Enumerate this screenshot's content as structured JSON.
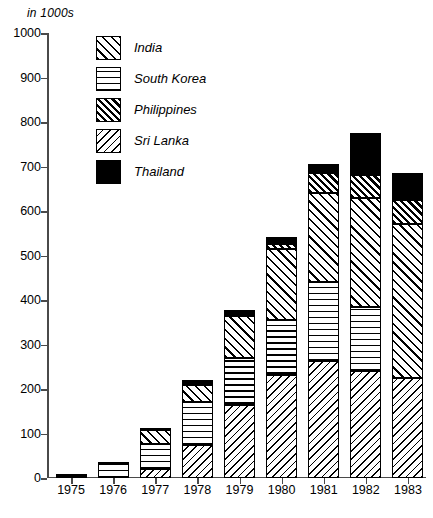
{
  "chart_data": {
    "type": "bar",
    "subtype": "stacked-bar",
    "title": "",
    "unit_label": "in 1000s",
    "xlabel": "",
    "ylabel": "",
    "ylim": [
      0,
      1000
    ],
    "ytick_step": 100,
    "grid": false,
    "legend_position": "top-left-inside",
    "categories": [
      "1975",
      "1976",
      "1977",
      "1978",
      "1979",
      "1980",
      "1981",
      "1982",
      "1983"
    ],
    "ytick_labels": [
      "0",
      "100",
      "200",
      "300",
      "400",
      "500",
      "600",
      "700",
      "800",
      "900",
      "1000"
    ],
    "series": [
      {
        "name": "Sri Lanka",
        "pattern": "diagonal-backslash-light",
        "values": [
          0,
          0,
          20,
          75,
          165,
          232,
          262,
          240,
          225
        ]
      },
      {
        "name": "South Korea",
        "pattern": "horizontal-lines",
        "values": [
          0,
          32,
          77,
          170,
          270,
          355,
          440,
          385,
          0
        ]
      },
      {
        "name": "India",
        "pattern": "diagonal-forwardslash-light",
        "values": [
          0,
          0,
          107,
          210,
          365,
          515,
          640,
          630,
          570
        ]
      },
      {
        "name": "Philippines",
        "pattern": "diagonal-forwardslash-dense",
        "values": [
          0,
          0,
          0,
          0,
          0,
          527,
          685,
          680,
          625
        ]
      },
      {
        "name": "Thailand",
        "pattern": "solid-black",
        "values": [
          10,
          35,
          108,
          220,
          378,
          542,
          705,
          775,
          685
        ]
      }
    ],
    "cumulative_tops_by_year": {
      "1975": {
        "Thailand": 10
      },
      "1976": {
        "South Korea": 32,
        "Thailand": 35
      },
      "1977": {
        "Sri Lanka": 20,
        "South Korea": 77,
        "India": 107,
        "Thailand": 108
      },
      "1978": {
        "Sri Lanka": 75,
        "South Korea": 170,
        "India": 210,
        "Thailand": 220
      },
      "1979": {
        "Sri Lanka": 165,
        "South Korea": 270,
        "India": 365,
        "Thailand": 378
      },
      "1980": {
        "Sri Lanka": 232,
        "South Korea": 355,
        "India": 515,
        "Philippines": 527,
        "Thailand": 542
      },
      "1981": {
        "Sri Lanka": 262,
        "South Korea": 440,
        "India": 640,
        "Philippines": 685,
        "Thailand": 705
      },
      "1982": {
        "Sri Lanka": 240,
        "South Korea": 385,
        "India": 630,
        "Philippines": 680,
        "Thailand": 775
      },
      "1983": {
        "Sri Lanka": 225,
        "India": 570,
        "Philippines": 625,
        "Thailand": 685
      }
    },
    "bars": [
      {
        "year": "1975",
        "total": 10,
        "segments": [
          {
            "name": "Thailand",
            "from": 0,
            "to": 10
          }
        ]
      },
      {
        "year": "1976",
        "total": 35,
        "segments": [
          {
            "name": "South Korea",
            "from": 0,
            "to": 32
          },
          {
            "name": "Thailand",
            "from": 32,
            "to": 35
          }
        ]
      },
      {
        "year": "1977",
        "total": 108,
        "segments": [
          {
            "name": "Sri Lanka",
            "from": 0,
            "to": 20
          },
          {
            "name": "South Korea",
            "from": 20,
            "to": 77
          },
          {
            "name": "India",
            "from": 77,
            "to": 107
          },
          {
            "name": "Thailand",
            "from": 107,
            "to": 108
          }
        ]
      },
      {
        "year": "1978",
        "total": 220,
        "segments": [
          {
            "name": "Sri Lanka",
            "from": 0,
            "to": 75
          },
          {
            "name": "South Korea",
            "from": 75,
            "to": 170
          },
          {
            "name": "India",
            "from": 170,
            "to": 210
          },
          {
            "name": "Thailand",
            "from": 210,
            "to": 220
          }
        ]
      },
      {
        "year": "1979",
        "total": 378,
        "segments": [
          {
            "name": "Sri Lanka",
            "from": 0,
            "to": 165
          },
          {
            "name": "South Korea",
            "from": 165,
            "to": 270
          },
          {
            "name": "India",
            "from": 270,
            "to": 365
          },
          {
            "name": "Thailand",
            "from": 365,
            "to": 378
          }
        ]
      },
      {
        "year": "1980",
        "total": 542,
        "segments": [
          {
            "name": "Sri Lanka",
            "from": 0,
            "to": 232
          },
          {
            "name": "South Korea",
            "from": 232,
            "to": 355
          },
          {
            "name": "India",
            "from": 355,
            "to": 515
          },
          {
            "name": "Philippines",
            "from": 515,
            "to": 527
          },
          {
            "name": "Thailand",
            "from": 527,
            "to": 542
          }
        ]
      },
      {
        "year": "1981",
        "total": 705,
        "segments": [
          {
            "name": "Sri Lanka",
            "from": 0,
            "to": 262
          },
          {
            "name": "South Korea",
            "from": 262,
            "to": 440
          },
          {
            "name": "India",
            "from": 440,
            "to": 640
          },
          {
            "name": "Philippines",
            "from": 640,
            "to": 685
          },
          {
            "name": "Thailand",
            "from": 685,
            "to": 705
          }
        ]
      },
      {
        "year": "1982",
        "total": 775,
        "segments": [
          {
            "name": "Sri Lanka",
            "from": 0,
            "to": 240
          },
          {
            "name": "South Korea",
            "from": 240,
            "to": 385
          },
          {
            "name": "India",
            "from": 385,
            "to": 630
          },
          {
            "name": "Philippines",
            "from": 630,
            "to": 680
          },
          {
            "name": "Thailand",
            "from": 680,
            "to": 775
          }
        ]
      },
      {
        "year": "1983",
        "total": 685,
        "segments": [
          {
            "name": "Sri Lanka",
            "from": 0,
            "to": 225
          },
          {
            "name": "India",
            "from": 225,
            "to": 570
          },
          {
            "name": "Philippines",
            "from": 570,
            "to": 625
          },
          {
            "name": "Thailand",
            "from": 625,
            "to": 685
          }
        ]
      }
    ],
    "legend": [
      {
        "label": "India",
        "pattern": "pat-india"
      },
      {
        "label": "South Korea",
        "pattern": "pat-southkorea"
      },
      {
        "label": "Philippines",
        "pattern": "pat-philippines"
      },
      {
        "label": "Sri Lanka",
        "pattern": "pat-srilanka"
      },
      {
        "label": "Thailand",
        "pattern": "pat-thailand"
      }
    ],
    "colors": {
      "ink": "#000000",
      "axis": "#4a4a4a",
      "background": "#ffffff"
    }
  }
}
